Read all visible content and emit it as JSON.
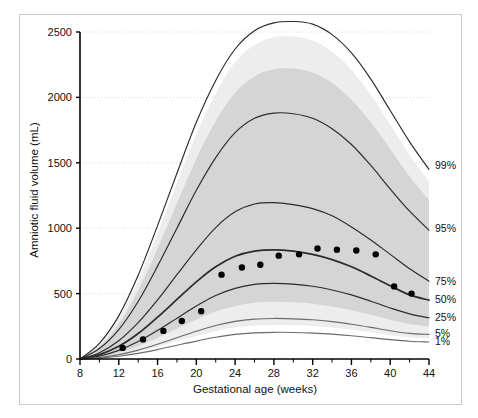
{
  "figure": {
    "background_color": "#ffffff",
    "frame_color": "#c9c9c9"
  },
  "chart_data": {
    "type": "line",
    "title": "",
    "subtitle": "",
    "xlabel": "Gestational age (weeks)",
    "ylabel": "Amniotic fluid volume (mL)",
    "xlim": [
      8,
      44
    ],
    "ylim": [
      0,
      2500
    ],
    "xticks": [
      8,
      12,
      16,
      20,
      24,
      28,
      32,
      36,
      40,
      44
    ],
    "xtick_labels": [
      "8",
      "12",
      "16",
      "20",
      "24",
      "28",
      "32",
      "36",
      "40",
      "44"
    ],
    "x_minor_tick_step": 2,
    "yticks": [
      0,
      500,
      1000,
      1500,
      2000,
      2500
    ],
    "ytick_labels": [
      "0",
      "500",
      "1000",
      "1500",
      "2000",
      "2500"
    ],
    "grid": "horizontal-dotted",
    "grid_color": "#d8d8d8",
    "legend_position": "right-inline-labels",
    "curve_color": "#2b2b2b",
    "band_color": "#d5d5d5",
    "band_color_light": "#ededed",
    "point_color": "#000000",
    "x": [
      8,
      10,
      12,
      14,
      16,
      18,
      20,
      22,
      24,
      26,
      28,
      30,
      32,
      34,
      36,
      38,
      40,
      42,
      44
    ],
    "series": [
      {
        "name": "99%",
        "label": "99%",
        "label_value_at_44": 1480,
        "values": [
          0,
          120,
          330,
          640,
          1020,
          1420,
          1810,
          2130,
          2370,
          2510,
          2570,
          2580,
          2560,
          2480,
          2340,
          2140,
          1900,
          1660,
          1450
        ]
      },
      {
        "name": "95%",
        "label": "95%",
        "label_value_at_44": 1000,
        "values": [
          0,
          80,
          225,
          440,
          710,
          1000,
          1290,
          1540,
          1730,
          1840,
          1880,
          1875,
          1840,
          1760,
          1640,
          1480,
          1300,
          1130,
          985
        ]
      },
      {
        "name": "75%",
        "label": "75%",
        "label_value_at_44": 600,
        "values": [
          0,
          48,
          140,
          278,
          452,
          645,
          835,
          1005,
          1125,
          1185,
          1195,
          1180,
          1150,
          1095,
          1010,
          910,
          800,
          690,
          595
        ]
      },
      {
        "name": "50%",
        "label": "50%",
        "label_value_at_44": 455,
        "values": [
          0,
          33,
          97,
          195,
          320,
          455,
          590,
          705,
          785,
          825,
          835,
          825,
          800,
          760,
          705,
          635,
          560,
          490,
          450
        ]
      },
      {
        "name": "25%",
        "label": "25%",
        "label_value_at_44": 320,
        "values": [
          0,
          22,
          66,
          133,
          218,
          312,
          405,
          485,
          540,
          570,
          578,
          572,
          556,
          528,
          490,
          442,
          390,
          345,
          315
        ]
      },
      {
        "name": "5%",
        "label": "5%",
        "label_value_at_44": 195,
        "values": [
          0,
          11,
          33,
          68,
          113,
          163,
          212,
          256,
          288,
          305,
          310,
          307,
          300,
          286,
          266,
          242,
          216,
          196,
          188
        ]
      },
      {
        "name": "1%",
        "label": "1%",
        "label_value_at_44": 135,
        "values": [
          0,
          7,
          21,
          43,
          72,
          105,
          137,
          166,
          188,
          200,
          204,
          203,
          198,
          190,
          178,
          163,
          148,
          136,
          130
        ]
      }
    ],
    "band": {
      "name": "reference-range-band",
      "upper": [
        0,
        95,
        268,
        525,
        845,
        1190,
        1530,
        1820,
        2035,
        2160,
        2215,
        2220,
        2190,
        2110,
        1980,
        1810,
        1605,
        1395,
        1215
      ],
      "lower": [
        0,
        16,
        48,
        98,
        162,
        232,
        302,
        363,
        406,
        430,
        437,
        433,
        422,
        401,
        373,
        338,
        300,
        268,
        250
      ]
    },
    "band_light": {
      "name": "outer-light-band",
      "upper": [
        0,
        110,
        310,
        600,
        960,
        1345,
        1720,
        2030,
        2270,
        2400,
        2460,
        2465,
        2435,
        2350,
        2210,
        2020,
        1790,
        1560,
        1360
      ],
      "lower": [
        0,
        9,
        27,
        56,
        93,
        135,
        176,
        213,
        240,
        255,
        260,
        258,
        252,
        240,
        224,
        204,
        182,
        165,
        158
      ]
    },
    "points": {
      "name": "observed-means",
      "marker": "filled-circle",
      "x": [
        12.4,
        14.5,
        16.6,
        18.5,
        20.5,
        22.6,
        24.7,
        26.6,
        28.5,
        30.6,
        32.5,
        34.5,
        36.5,
        38.5,
        40.4,
        42.2
      ],
      "y": [
        85,
        150,
        215,
        290,
        365,
        645,
        700,
        720,
        790,
        800,
        845,
        835,
        830,
        800,
        555,
        500
      ]
    },
    "annotations": []
  }
}
